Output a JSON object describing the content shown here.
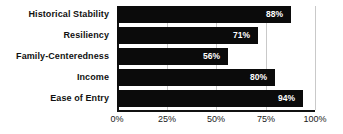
{
  "chart_data": {
    "type": "bar",
    "orientation": "horizontal",
    "title": "",
    "subtitle": "",
    "xlabel": "",
    "ylabel": "",
    "categories": [
      "Historical Stability",
      "Resiliency",
      "Family-Centeredness",
      "Income",
      "Ease of Entry"
    ],
    "values": [
      88,
      71,
      56,
      80,
      94
    ],
    "value_labels": [
      "88%",
      "71%",
      "56%",
      "80%",
      "94%"
    ],
    "xlim": [
      0,
      100
    ],
    "xticks": [
      0,
      25,
      50,
      75,
      100
    ],
    "xtick_labels": [
      "0%",
      "25%",
      "50%",
      "75%",
      "100%"
    ],
    "grid": true,
    "grid_axis": "x",
    "legend": false,
    "legend_position": "none",
    "series": [
      {
        "name": "",
        "values": [
          88,
          71,
          56,
          80,
          94
        ]
      }
    ]
  },
  "style": {
    "bar_color": "#0b0b0b",
    "value_label_color": "#ffffff",
    "category_label_color": "#111111",
    "grid_color": "#c9c9c9",
    "axis_color": "#111111",
    "background": "#ffffff"
  }
}
